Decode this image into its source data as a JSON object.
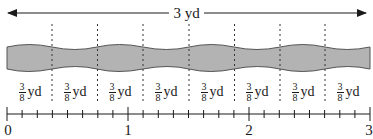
{
  "diagram": {
    "title_measure": "3 yd",
    "total_length_yd": 3,
    "segment_count": 8,
    "segment_label": {
      "numerator": "3",
      "denominator": "8",
      "unit": "yd"
    },
    "segments": [
      {
        "numerator": "3",
        "denominator": "8",
        "unit": "yd"
      },
      {
        "numerator": "3",
        "denominator": "8",
        "unit": "yd"
      },
      {
        "numerator": "3",
        "denominator": "8",
        "unit": "yd"
      },
      {
        "numerator": "3",
        "denominator": "8",
        "unit": "yd"
      },
      {
        "numerator": "3",
        "denominator": "8",
        "unit": "yd"
      },
      {
        "numerator": "3",
        "denominator": "8",
        "unit": "yd"
      },
      {
        "numerator": "3",
        "denominator": "8",
        "unit": "yd"
      },
      {
        "numerator": "3",
        "denominator": "8",
        "unit": "yd"
      }
    ],
    "number_line": {
      "min": 0,
      "max": 3,
      "ticks_per_unit": 8,
      "labels": [
        "0",
        "1",
        "2",
        "3"
      ]
    },
    "colors": {
      "ribbon_fill": "#b3b3b3",
      "ribbon_stroke": "#555555",
      "line": "#1a1a1a",
      "dashed": "#333333"
    }
  }
}
